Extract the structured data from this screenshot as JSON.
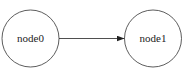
{
  "diagram": {
    "nodes": [
      {
        "id": "node0",
        "label": "node0",
        "cx": 30.5,
        "cy": 38.5,
        "r": 28.5
      },
      {
        "id": "node1",
        "label": "node1",
        "cx": 153,
        "cy": 38.5,
        "r": 28.5
      }
    ],
    "edges": [
      {
        "from": "node0",
        "to": "node1",
        "directed": true
      }
    ],
    "colors": {
      "stroke": "#333333",
      "background": "#ffffff",
      "text": "#222222"
    }
  }
}
